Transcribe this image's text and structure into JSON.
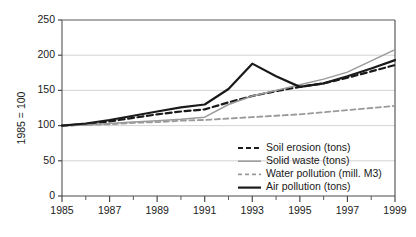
{
  "chart_data": {
    "type": "line",
    "title": "",
    "xlabel": "",
    "ylabel": "1985 = 100",
    "xlim": [
      1985,
      1999
    ],
    "ylim": [
      0,
      250
    ],
    "yticks": [
      0,
      50,
      100,
      150,
      200,
      250
    ],
    "xticks": [
      1985,
      1986,
      1987,
      1988,
      1989,
      1990,
      1991,
      1992,
      1993,
      1994,
      1995,
      1996,
      1997,
      1998,
      1999
    ],
    "xtick_labels_shown": [
      "1985",
      "1987",
      "1989",
      "1991",
      "1993",
      "1995",
      "1997",
      "1999"
    ],
    "grid": "horizontal",
    "legend_position": "bottom-right",
    "x": [
      1985,
      1986,
      1987,
      1988,
      1989,
      1990,
      1991,
      1992,
      1993,
      1994,
      1995,
      1996,
      1997,
      1998,
      1999
    ],
    "series": [
      {
        "name": "Soil erosion (tons)",
        "style": "dashed",
        "color": "#1a1a1a",
        "width": 2.2,
        "values": [
          100,
          102,
          106,
          111,
          116,
          120,
          123,
          133,
          142,
          149,
          155,
          160,
          168,
          177,
          186
        ]
      },
      {
        "name": "Solid waste (tons)",
        "style": "solid",
        "color": "#9a9a9a",
        "width": 1.5,
        "values": [
          100,
          101,
          103,
          105,
          107,
          109,
          112,
          130,
          142,
          150,
          158,
          166,
          176,
          192,
          208
        ]
      },
      {
        "name": "Water pollution (mill. M3)",
        "style": "dashed",
        "color": "#9a9a9a",
        "width": 1.9,
        "values": [
          100,
          101,
          102,
          104,
          105,
          107,
          108,
          110,
          112,
          114,
          116,
          119,
          122,
          125,
          128
        ]
      },
      {
        "name": "Air pollution (tons)",
        "style": "solid",
        "color": "#1a1a1a",
        "width": 2.2,
        "values": [
          100,
          103,
          108,
          114,
          120,
          126,
          130,
          152,
          188,
          170,
          155,
          160,
          170,
          181,
          193
        ]
      }
    ]
  },
  "legend": {
    "items": [
      {
        "label": "Soil erosion (tons)"
      },
      {
        "label": "Solid waste (tons)"
      },
      {
        "label": "Water pollution (mill. M3)"
      },
      {
        "label": "Air pollution (tons)"
      }
    ]
  },
  "axes": {
    "y_title": "1985 = 100",
    "y_labels": [
      "250",
      "200",
      "150",
      "100",
      "50",
      "0"
    ],
    "x_labels": [
      "1985",
      "1987",
      "1989",
      "1991",
      "1993",
      "1995",
      "1997",
      "1999"
    ]
  }
}
